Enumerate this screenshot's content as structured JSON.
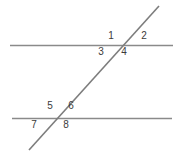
{
  "figure": {
    "background_color": "#ffffff",
    "width": 182,
    "height": 153
  },
  "style": {
    "line_color": "#8a8a8a",
    "transversal_color": "#7d7d7d",
    "label_color": "#3b3b3b",
    "line_width": 1.6,
    "label_font_size": 10
  },
  "lines": [
    {
      "name": "upper-parallel-line",
      "role": "parallel",
      "x1": 10,
      "y1": 45.5,
      "x2": 173,
      "y2": 45.5
    },
    {
      "name": "lower-parallel-line",
      "role": "parallel",
      "x1": 12,
      "y1": 118.5,
      "x2": 172,
      "y2": 118.5
    },
    {
      "name": "transversal-line",
      "role": "transversal",
      "x1": 29,
      "y1": 150,
      "x2": 159,
      "y2": 6
    }
  ],
  "intersections": [
    {
      "name": "upper-intersection",
      "x": 117,
      "y": 45.5
    },
    {
      "name": "lower-intersection",
      "x": 58,
      "y": 118.5
    }
  ],
  "angle_labels": [
    {
      "id": "1",
      "text": "1",
      "x": 106,
      "y": 31,
      "position": "upper-left-above",
      "intersection": "upper-intersection"
    },
    {
      "id": "2",
      "text": "2",
      "x": 139,
      "y": 31,
      "position": "upper-right-above",
      "intersection": "upper-intersection"
    },
    {
      "id": "3",
      "text": "3",
      "x": 96,
      "y": 47,
      "position": "lower-left-below",
      "intersection": "upper-intersection"
    },
    {
      "id": "4",
      "text": "4",
      "x": 119,
      "y": 47,
      "position": "lower-right-below",
      "intersection": "upper-intersection"
    },
    {
      "id": "5",
      "text": "5",
      "x": 45,
      "y": 101,
      "position": "upper-left-above",
      "intersection": "lower-intersection"
    },
    {
      "id": "6",
      "text": "6",
      "x": 66,
      "y": 101,
      "position": "upper-right-above",
      "intersection": "lower-intersection"
    },
    {
      "id": "7",
      "text": "7",
      "x": 29,
      "y": 120,
      "position": "lower-left-below",
      "intersection": "lower-intersection"
    },
    {
      "id": "8",
      "text": "8",
      "x": 61,
      "y": 120,
      "position": "lower-right-below",
      "intersection": "lower-intersection"
    }
  ]
}
